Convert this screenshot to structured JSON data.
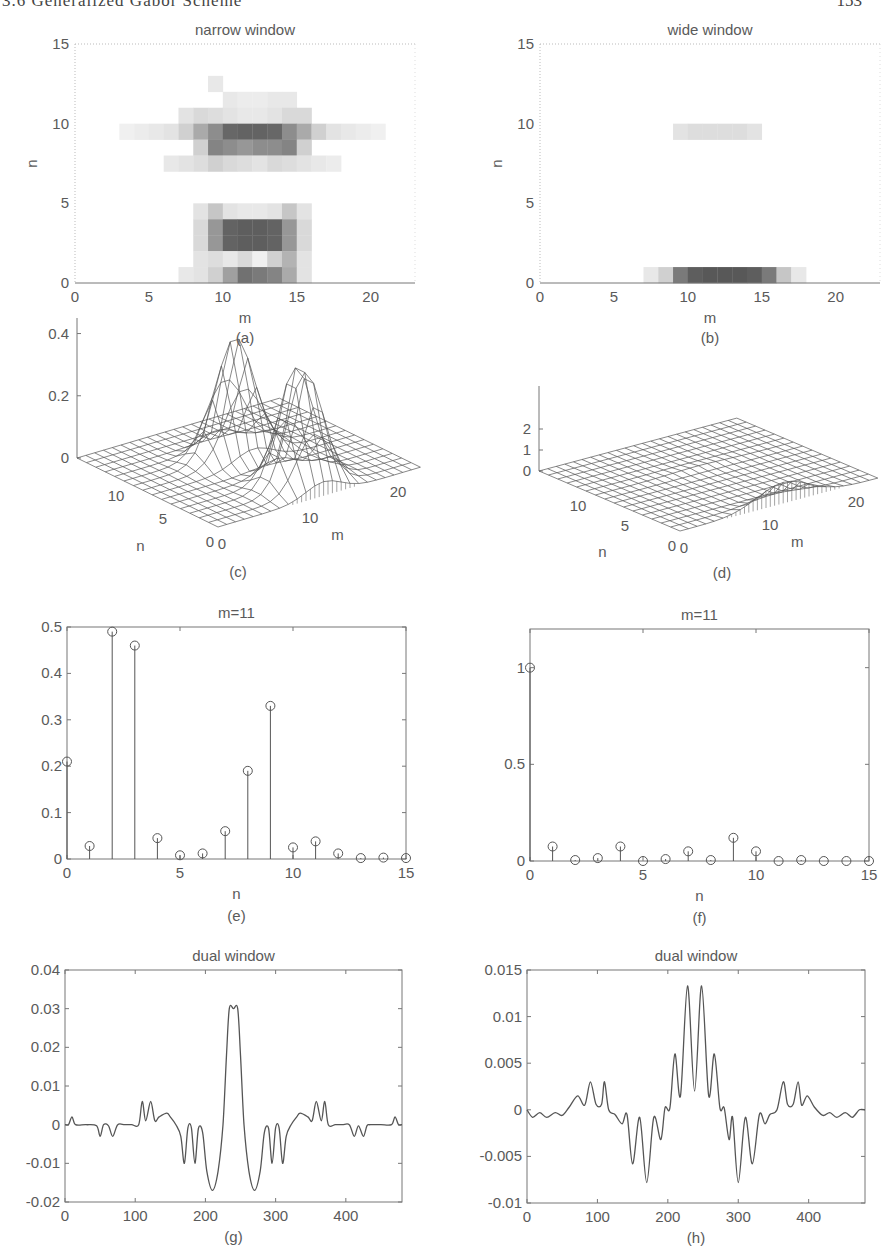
{
  "page": {
    "running_head": "3.6 Generalized Gabor Scheme",
    "page_number": "153"
  },
  "chart_data": [
    {
      "id": "a",
      "type": "heatmap",
      "title": "narrow window",
      "xlabel": "m",
      "ylabel": "n",
      "caption": "(a)",
      "xlim": [
        0,
        23
      ],
      "ylim": [
        0,
        15
      ],
      "xticks": [
        0,
        5,
        10,
        15,
        20
      ],
      "yticks": [
        0,
        5,
        10,
        15
      ],
      "colormap": "gray-reversed",
      "cells": [
        {
          "m": 9,
          "n": 12,
          "v": 0.12
        },
        {
          "m": 10,
          "n": 11,
          "v": 0.12
        },
        {
          "m": 11,
          "n": 11,
          "v": 0.1
        },
        {
          "m": 12,
          "n": 11,
          "v": 0.1
        },
        {
          "m": 13,
          "n": 11,
          "v": 0.12
        },
        {
          "m": 14,
          "n": 11,
          "v": 0.12
        },
        {
          "m": 7,
          "n": 10,
          "v": 0.15
        },
        {
          "m": 8,
          "n": 10,
          "v": 0.2
        },
        {
          "m": 9,
          "n": 10,
          "v": 0.18
        },
        {
          "m": 10,
          "n": 10,
          "v": 0.15
        },
        {
          "m": 11,
          "n": 10,
          "v": 0.12
        },
        {
          "m": 12,
          "n": 10,
          "v": 0.12
        },
        {
          "m": 13,
          "n": 10,
          "v": 0.15
        },
        {
          "m": 14,
          "n": 10,
          "v": 0.2
        },
        {
          "m": 15,
          "n": 10,
          "v": 0.2
        },
        {
          "m": 3,
          "n": 9,
          "v": 0.08
        },
        {
          "m": 4,
          "n": 9,
          "v": 0.1
        },
        {
          "m": 5,
          "n": 9,
          "v": 0.12
        },
        {
          "m": 6,
          "n": 9,
          "v": 0.15
        },
        {
          "m": 7,
          "n": 9,
          "v": 0.25
        },
        {
          "m": 8,
          "n": 9,
          "v": 0.45
        },
        {
          "m": 9,
          "n": 9,
          "v": 0.6
        },
        {
          "m": 10,
          "n": 9,
          "v": 0.8
        },
        {
          "m": 11,
          "n": 9,
          "v": 0.82
        },
        {
          "m": 12,
          "n": 9,
          "v": 0.82
        },
        {
          "m": 13,
          "n": 9,
          "v": 0.8
        },
        {
          "m": 14,
          "n": 9,
          "v": 0.6
        },
        {
          "m": 15,
          "n": 9,
          "v": 0.45
        },
        {
          "m": 16,
          "n": 9,
          "v": 0.25
        },
        {
          "m": 17,
          "n": 9,
          "v": 0.15
        },
        {
          "m": 18,
          "n": 9,
          "v": 0.12
        },
        {
          "m": 19,
          "n": 9,
          "v": 0.1
        },
        {
          "m": 20,
          "n": 9,
          "v": 0.08
        },
        {
          "m": 8,
          "n": 8,
          "v": 0.25
        },
        {
          "m": 9,
          "n": 8,
          "v": 0.65
        },
        {
          "m": 10,
          "n": 8,
          "v": 0.6
        },
        {
          "m": 11,
          "n": 8,
          "v": 0.55
        },
        {
          "m": 12,
          "n": 8,
          "v": 0.6
        },
        {
          "m": 13,
          "n": 8,
          "v": 0.6
        },
        {
          "m": 14,
          "n": 8,
          "v": 0.65
        },
        {
          "m": 15,
          "n": 8,
          "v": 0.25
        },
        {
          "m": 6,
          "n": 7,
          "v": 0.12
        },
        {
          "m": 7,
          "n": 7,
          "v": 0.15
        },
        {
          "m": 8,
          "n": 7,
          "v": 0.18
        },
        {
          "m": 9,
          "n": 7,
          "v": 0.25
        },
        {
          "m": 10,
          "n": 7,
          "v": 0.2
        },
        {
          "m": 11,
          "n": 7,
          "v": 0.18
        },
        {
          "m": 12,
          "n": 7,
          "v": 0.15
        },
        {
          "m": 13,
          "n": 7,
          "v": 0.2
        },
        {
          "m": 14,
          "n": 7,
          "v": 0.18
        },
        {
          "m": 15,
          "n": 7,
          "v": 0.15
        },
        {
          "m": 16,
          "n": 7,
          "v": 0.12
        },
        {
          "m": 17,
          "n": 7,
          "v": 0.1
        },
        {
          "m": 8,
          "n": 4,
          "v": 0.15
        },
        {
          "m": 9,
          "n": 4,
          "v": 0.3
        },
        {
          "m": 10,
          "n": 4,
          "v": 0.15
        },
        {
          "m": 11,
          "n": 4,
          "v": 0.12
        },
        {
          "m": 12,
          "n": 4,
          "v": 0.12
        },
        {
          "m": 13,
          "n": 4,
          "v": 0.15
        },
        {
          "m": 14,
          "n": 4,
          "v": 0.3
        },
        {
          "m": 15,
          "n": 4,
          "v": 0.15
        },
        {
          "m": 8,
          "n": 3,
          "v": 0.2
        },
        {
          "m": 9,
          "n": 3,
          "v": 0.55
        },
        {
          "m": 10,
          "n": 3,
          "v": 0.82
        },
        {
          "m": 11,
          "n": 3,
          "v": 0.85
        },
        {
          "m": 12,
          "n": 3,
          "v": 0.85
        },
        {
          "m": 13,
          "n": 3,
          "v": 0.82
        },
        {
          "m": 14,
          "n": 3,
          "v": 0.55
        },
        {
          "m": 15,
          "n": 3,
          "v": 0.2
        },
        {
          "m": 8,
          "n": 2,
          "v": 0.2
        },
        {
          "m": 9,
          "n": 2,
          "v": 0.55
        },
        {
          "m": 10,
          "n": 2,
          "v": 0.82
        },
        {
          "m": 11,
          "n": 2,
          "v": 0.85
        },
        {
          "m": 12,
          "n": 2,
          "v": 0.85
        },
        {
          "m": 13,
          "n": 2,
          "v": 0.82
        },
        {
          "m": 14,
          "n": 2,
          "v": 0.55
        },
        {
          "m": 15,
          "n": 2,
          "v": 0.2
        },
        {
          "m": 8,
          "n": 1,
          "v": 0.15
        },
        {
          "m": 9,
          "n": 1,
          "v": 0.18
        },
        {
          "m": 10,
          "n": 1,
          "v": 0.12
        },
        {
          "m": 11,
          "n": 1,
          "v": 0.2
        },
        {
          "m": 12,
          "n": 1,
          "v": 0.08
        },
        {
          "m": 13,
          "n": 1,
          "v": 0.25
        },
        {
          "m": 14,
          "n": 1,
          "v": 0.4
        },
        {
          "m": 15,
          "n": 1,
          "v": 0.15
        },
        {
          "m": 7,
          "n": 0,
          "v": 0.12
        },
        {
          "m": 8,
          "n": 0,
          "v": 0.15
        },
        {
          "m": 9,
          "n": 0,
          "v": 0.25
        },
        {
          "m": 10,
          "n": 0,
          "v": 0.5
        },
        {
          "m": 11,
          "n": 0,
          "v": 0.75
        },
        {
          "m": 12,
          "n": 0,
          "v": 0.7
        },
        {
          "m": 13,
          "n": 0,
          "v": 0.65
        },
        {
          "m": 14,
          "n": 0,
          "v": 0.45
        },
        {
          "m": 15,
          "n": 0,
          "v": 0.15
        }
      ]
    },
    {
      "id": "b",
      "type": "heatmap",
      "title": "wide window",
      "xlabel": "m",
      "ylabel": "n",
      "caption": "(b)",
      "xlim": [
        0,
        23
      ],
      "ylim": [
        0,
        15
      ],
      "xticks": [
        0,
        5,
        10,
        15,
        20
      ],
      "yticks": [
        0,
        5,
        10,
        15
      ],
      "colormap": "gray-reversed",
      "cells": [
        {
          "m": 9,
          "n": 9,
          "v": 0.15
        },
        {
          "m": 10,
          "n": 9,
          "v": 0.18
        },
        {
          "m": 11,
          "n": 9,
          "v": 0.18
        },
        {
          "m": 12,
          "n": 9,
          "v": 0.18
        },
        {
          "m": 13,
          "n": 9,
          "v": 0.18
        },
        {
          "m": 14,
          "n": 9,
          "v": 0.15
        },
        {
          "m": 7,
          "n": 0,
          "v": 0.12
        },
        {
          "m": 8,
          "n": 0,
          "v": 0.25
        },
        {
          "m": 9,
          "n": 0,
          "v": 0.7
        },
        {
          "m": 10,
          "n": 0,
          "v": 0.85
        },
        {
          "m": 11,
          "n": 0,
          "v": 0.88
        },
        {
          "m": 12,
          "n": 0,
          "v": 0.88
        },
        {
          "m": 13,
          "n": 0,
          "v": 0.88
        },
        {
          "m": 14,
          "n": 0,
          "v": 0.85
        },
        {
          "m": 15,
          "n": 0,
          "v": 0.7
        },
        {
          "m": 16,
          "n": 0,
          "v": 0.3
        },
        {
          "m": 17,
          "n": 0,
          "v": 0.12
        }
      ]
    },
    {
      "id": "c",
      "type": "surface",
      "title": "",
      "xlabel": "m",
      "ylabel": "n",
      "caption": "(c)",
      "zlim": [
        0,
        0.45
      ],
      "zticks": [
        "0",
        "0.2",
        "0.4"
      ],
      "mticks": [
        "0",
        "10",
        "20"
      ],
      "nticks": [
        "0",
        "5",
        "10"
      ],
      "peaks": [
        {
          "m": 11.5,
          "n": 9,
          "z": 0.38,
          "m_spread": 2.2,
          "n_spread": 1.0
        },
        {
          "m": 12,
          "n": 2.5,
          "z": 0.4,
          "m_spread": 2.0,
          "n_spread": 1.2
        }
      ]
    },
    {
      "id": "d",
      "type": "surface",
      "title": "",
      "xlabel": "m",
      "ylabel": "n",
      "caption": "(d)",
      "zlim": [
        0,
        2
      ],
      "zticks": [
        "0",
        "1",
        "2"
      ],
      "mticks": [
        "0",
        "10",
        "20"
      ],
      "nticks": [
        "0",
        "5",
        "10"
      ],
      "peaks": [
        {
          "m": 12,
          "n": 0,
          "z": 1.0,
          "m_spread": 3.0,
          "n_spread": 0.6
        },
        {
          "m": 12,
          "n": 9,
          "z": 0.08,
          "m_spread": 3.0,
          "n_spread": 0.6
        }
      ]
    },
    {
      "id": "e",
      "type": "stem",
      "title": "m=11",
      "xlabel": "n",
      "caption": "(e)",
      "xlim": [
        0,
        15
      ],
      "ylim": [
        0,
        0.5
      ],
      "xticks": [
        "0",
        "5",
        "10",
        "15"
      ],
      "yticks": [
        "0",
        "0.1",
        "0.2",
        "0.3",
        "0.4",
        "0.5"
      ],
      "x": [
        0,
        1,
        2,
        3,
        4,
        5,
        6,
        7,
        8,
        9,
        10,
        11,
        12,
        13,
        14,
        15
      ],
      "values": [
        0.21,
        0.028,
        0.49,
        0.46,
        0.045,
        0.008,
        0.012,
        0.06,
        0.19,
        0.33,
        0.025,
        0.038,
        0.012,
        0.002,
        0.003,
        0.002
      ]
    },
    {
      "id": "f",
      "type": "stem",
      "title": "m=11",
      "xlabel": "n",
      "caption": "(f)",
      "xlim": [
        0,
        15
      ],
      "ylim": [
        0,
        1.2
      ],
      "xticks": [
        "0",
        "5",
        "10",
        "15"
      ],
      "yticks": [
        "0",
        "0.5",
        "1"
      ],
      "x": [
        0,
        1,
        2,
        3,
        4,
        5,
        6,
        7,
        8,
        9,
        10,
        11,
        12,
        13,
        14,
        15
      ],
      "values": [
        1.0,
        0.075,
        0.005,
        0.015,
        0.075,
        0.0,
        0.01,
        0.05,
        0.005,
        0.12,
        0.05,
        0.0,
        0.005,
        0.0,
        0.0,
        0.0
      ]
    },
    {
      "id": "g",
      "type": "line",
      "title": "dual window",
      "xlabel": "",
      "caption": "(g)",
      "xlim": [
        0,
        480
      ],
      "ylim": [
        -0.02,
        0.04
      ],
      "xticks": [
        "0",
        "100",
        "200",
        "300",
        "400"
      ],
      "yticks": [
        "-0.02",
        "-0.01",
        "0",
        "0.01",
        "0.02",
        "0.03",
        "0.04"
      ],
      "x": [
        0,
        5,
        10,
        15,
        30,
        45,
        50,
        55,
        62,
        68,
        75,
        85,
        95,
        105,
        110,
        115,
        122,
        128,
        134,
        145,
        150,
        158,
        165,
        170,
        175,
        180,
        185,
        190,
        196,
        202,
        210,
        218,
        225,
        230,
        234,
        240,
        246,
        250,
        255,
        262,
        270,
        278,
        284,
        290,
        295,
        300,
        305,
        310,
        315,
        322,
        330,
        335,
        346,
        352,
        358,
        365,
        370,
        375,
        385,
        395,
        405,
        412,
        418,
        425,
        430,
        435,
        450,
        465,
        470,
        475,
        480
      ],
      "values": [
        0,
        0,
        0.002,
        0,
        0,
        -0.0003,
        -0.003,
        0,
        -0.0003,
        -0.003,
        0,
        0,
        0,
        0,
        0.006,
        0.001,
        0.006,
        0.001,
        0.002,
        0.003,
        0.002,
        0,
        -0.003,
        -0.01,
        -0.0008,
        -0.0008,
        -0.01,
        -0.001,
        -0.002,
        -0.012,
        -0.017,
        -0.012,
        0.0,
        0.018,
        0.03,
        0.03,
        0.03,
        0.018,
        0.0,
        -0.012,
        -0.017,
        -0.012,
        -0.002,
        -0.001,
        -0.01,
        -0.0008,
        -0.0008,
        -0.01,
        -0.003,
        0,
        0.002,
        0.003,
        0.002,
        0.001,
        0.006,
        0.001,
        0.006,
        0,
        0,
        0,
        0,
        -0.003,
        -0.0003,
        -0.003,
        -0.0003,
        0,
        0,
        0,
        0.002,
        0,
        0
      ]
    },
    {
      "id": "h",
      "type": "line",
      "title": "dual window",
      "xlabel": "",
      "caption": "(h)",
      "xlim": [
        0,
        480
      ],
      "ylim": [
        -0.01,
        0.015
      ],
      "xticks": [
        "0",
        "100",
        "200",
        "300",
        "400"
      ],
      "yticks": [
        "-0.01",
        "-0.005",
        "0",
        "0.005",
        "0.01",
        "0.015"
      ],
      "x": [
        0,
        8,
        18,
        28,
        40,
        50,
        60,
        72,
        82,
        90,
        98,
        106,
        110,
        116,
        125,
        135,
        142,
        150,
        160,
        170,
        180,
        190,
        196,
        203,
        210,
        218,
        228,
        238,
        248,
        258,
        266,
        274,
        280,
        287,
        292,
        300,
        310,
        320,
        330,
        338,
        345,
        355,
        364,
        370,
        378,
        385,
        390,
        398,
        408,
        420,
        430,
        440,
        452,
        462,
        472,
        480
      ],
      "values": [
        0,
        -0.0008,
        -0.0003,
        -0.0008,
        -0.0003,
        -0.0006,
        0.0003,
        0.0015,
        0.0005,
        0.003,
        0.0006,
        0.0006,
        0.003,
        0,
        -0.0005,
        -0.0015,
        -0.0005,
        -0.0058,
        -0.0008,
        -0.0078,
        -0.0008,
        -0.0032,
        0.0002,
        0.0002,
        0.006,
        0.0015,
        0.0133,
        0.002,
        0.0133,
        0.0015,
        0.006,
        0.0002,
        0.0002,
        -0.0032,
        -0.0008,
        -0.0078,
        -0.0008,
        -0.0058,
        -0.0005,
        -0.0015,
        -0.0005,
        0,
        0.003,
        0.0006,
        0.0006,
        0.003,
        0.0005,
        0.0015,
        0.0003,
        -0.0006,
        -0.0003,
        -0.0008,
        -0.0003,
        -0.0008,
        0,
        0
      ]
    }
  ]
}
